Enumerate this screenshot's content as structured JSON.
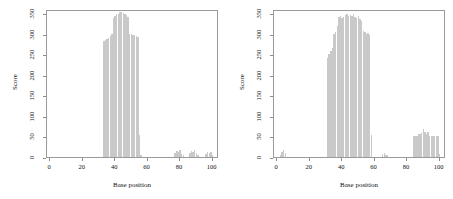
{
  "figure": {
    "background": "#ffffff",
    "bar_color": "#c9c9c9",
    "axis_color": "#8c8c8c"
  },
  "chart_data": [
    {
      "type": "bar",
      "panel": "left",
      "title": "",
      "xlabel": "Base position",
      "ylabel": "Score",
      "xlim": [
        -2,
        104
      ],
      "ylim": [
        0,
        360
      ],
      "xticks": [
        0,
        20,
        40,
        60,
        80,
        100
      ],
      "yticks": [
        0,
        50,
        100,
        150,
        200,
        250,
        300,
        350
      ],
      "grid": false,
      "legend": "none",
      "x": [
        33,
        34,
        35,
        36,
        37,
        38,
        39,
        40,
        41,
        42,
        43,
        44,
        45,
        46,
        47,
        48,
        49,
        50,
        51,
        52,
        53,
        54,
        55,
        56,
        77,
        78,
        79,
        80,
        81,
        82,
        86,
        87,
        88,
        89,
        90,
        91,
        96,
        97,
        98,
        99,
        100
      ],
      "values": [
        282,
        285,
        288,
        290,
        294,
        300,
        338,
        343,
        347,
        349,
        352,
        353,
        351,
        348,
        345,
        341,
        300,
        299,
        297,
        296,
        294,
        292,
        53,
        5,
        9,
        14,
        11,
        16,
        8,
        5,
        9,
        15,
        12,
        17,
        9,
        6,
        7,
        11,
        9,
        12,
        6
      ]
    },
    {
      "type": "bar",
      "panel": "right",
      "title": "",
      "xlabel": "Base position",
      "ylabel": "Score",
      "xlim": [
        -2,
        104
      ],
      "ylim": [
        0,
        360
      ],
      "xticks": [
        0,
        20,
        40,
        60,
        80,
        100
      ],
      "yticks": [
        0,
        50,
        100,
        150,
        200,
        250,
        300,
        350
      ],
      "grid": false,
      "legend": "none",
      "x": [
        2,
        3,
        4,
        5,
        31,
        32,
        33,
        34,
        35,
        36,
        37,
        38,
        39,
        40,
        41,
        42,
        43,
        44,
        45,
        46,
        47,
        48,
        49,
        50,
        51,
        52,
        53,
        54,
        55,
        56,
        57,
        58,
        65,
        66,
        67,
        68,
        84,
        85,
        86,
        87,
        88,
        89,
        90,
        91,
        92,
        93,
        94,
        95,
        96,
        97,
        98,
        99,
        100
      ],
      "values": [
        6,
        13,
        16,
        10,
        242,
        250,
        258,
        264,
        300,
        305,
        318,
        340,
        344,
        339,
        341,
        345,
        347,
        344,
        346,
        342,
        347,
        340,
        338,
        344,
        336,
        330,
        307,
        303,
        300,
        302,
        296,
        53,
        7,
        9,
        6,
        5,
        50,
        51,
        50,
        57,
        55,
        58,
        68,
        60,
        57,
        60,
        52,
        52,
        51,
        50,
        50,
        50,
        8
      ]
    }
  ],
  "left_panel": {
    "xlabel": "Base position",
    "ylabel": "Score",
    "xticks": [
      "0",
      "20",
      "40",
      "60",
      "80",
      "100"
    ],
    "yticks": [
      "0",
      "50",
      "100",
      "150",
      "200",
      "250",
      "300",
      "350"
    ]
  },
  "right_panel": {
    "xlabel": "Base position",
    "ylabel": "Score",
    "xticks": [
      "0",
      "20",
      "40",
      "60",
      "80",
      "100"
    ],
    "yticks": [
      "0",
      "50",
      "100",
      "150",
      "200",
      "250",
      "300",
      "350"
    ]
  }
}
